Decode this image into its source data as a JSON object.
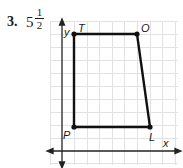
{
  "problem": {
    "number": "3.",
    "answer_whole": "5",
    "answer_numerator": "1",
    "answer_denominator": "2"
  },
  "graph": {
    "axes": {
      "x_label": "x",
      "y_label": "y"
    },
    "vertices": [
      {
        "name": "T",
        "x": 1,
        "y": 9
      },
      {
        "name": "O",
        "x": 6,
        "y": 9
      },
      {
        "name": "L",
        "x": 7,
        "y": 2
      },
      {
        "name": "P",
        "x": 1,
        "y": 2
      }
    ],
    "grid_step_px": 12.6,
    "colors": {
      "grid": "#e2e2e2",
      "line": "#111111",
      "axis": "#222222"
    }
  }
}
